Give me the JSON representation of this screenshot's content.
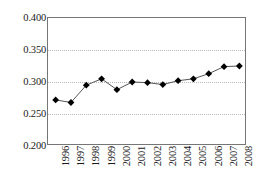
{
  "chart_data": {
    "type": "line",
    "title": "",
    "subtitle": "",
    "xlabel": "",
    "ylabel": "",
    "categories": [
      "1996",
      "1997",
      "1998",
      "1999",
      "2000",
      "2001",
      "2002",
      "2003",
      "2004",
      "2005",
      "2006",
      "2007",
      "2008"
    ],
    "values": [
      0.272,
      0.268,
      0.295,
      0.305,
      0.288,
      0.3,
      0.299,
      0.296,
      0.302,
      0.305,
      0.313,
      0.324,
      0.325
    ],
    "series": [
      {
        "name": "series-1",
        "values": [
          0.272,
          0.268,
          0.295,
          0.305,
          0.288,
          0.3,
          0.299,
          0.296,
          0.302,
          0.305,
          0.313,
          0.324,
          0.325
        ]
      }
    ],
    "ylim": [
      0.2,
      0.4
    ],
    "ytick_labels": [
      "0.400",
      "0.350",
      "0.300",
      "0.250",
      "0.200"
    ],
    "ytick_values": [
      0.4,
      0.35,
      0.3,
      0.25,
      0.2
    ],
    "xtick_labels": [
      "1996",
      "1997",
      "1998",
      "1999",
      "2000",
      "2001",
      "2002",
      "2003",
      "2004",
      "2005",
      "2006",
      "2007",
      "2008"
    ],
    "grid": true,
    "grid_style": "dotted-horizontal",
    "legend": false,
    "legend_position": "none",
    "marker": "diamond",
    "marker_color": "#000000",
    "line_color": "#555555",
    "axis_color": "#767676",
    "gridline_color": "#b9b9b9",
    "background_color": "#ffffff",
    "annotations": []
  }
}
